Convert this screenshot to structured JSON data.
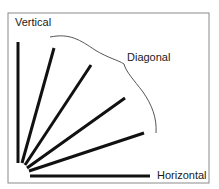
{
  "labels": {
    "vertical": "Vertical",
    "diagonal": "Diagonal",
    "horizontal": "Horizontal"
  },
  "colors": {
    "line": "#111111",
    "frame": "#888888",
    "brace": "#555555"
  }
}
